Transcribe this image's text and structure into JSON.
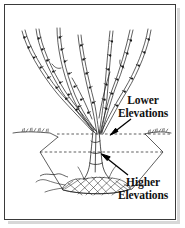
{
  "figure": {
    "kind": "botanical-cross-section-diagram",
    "background_color": "#ffffff",
    "ink_color": "#1a1a1a",
    "frame_color": "#3a3a3a",
    "shadow_color": "#d8d8d8"
  },
  "labels": {
    "lower": {
      "line1": "Lower",
      "line2": "Elevations"
    },
    "higher": {
      "line1": "Higher",
      "line2": "Elevations"
    }
  },
  "annotations": [
    {
      "name": "lower-elevations-arrow",
      "points_to": "upper dashed elevation line at trunk base",
      "direction": "down-left"
    },
    {
      "name": "higher-elevations-arrow",
      "points_to": "lower dashed elevation line at trunk",
      "direction": "up-left"
    }
  ],
  "elevation_lines": [
    {
      "name": "upper-dashed-elevation-line",
      "y": 134
    },
    {
      "name": "lower-dashed-elevation-line",
      "y": 152
    }
  ],
  "structure": {
    "branch_count": 7,
    "branches_have_buds": true,
    "ground_surface": "grass-tufted horizontal line",
    "soil_pit": "trapezoidal excavation walls",
    "root_mass": "diamond cross-hatched root ball"
  }
}
